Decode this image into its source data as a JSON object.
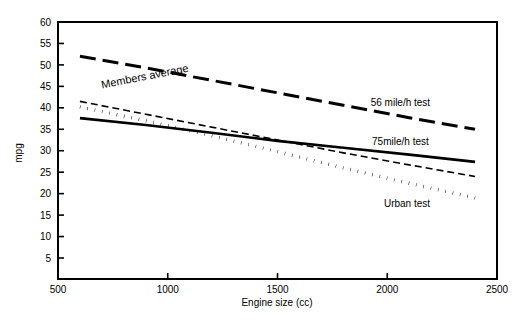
{
  "chart_data": {
    "type": "line",
    "title": "",
    "xlabel": "Engine size (cc)",
    "ylabel": "mpg",
    "xlim": [
      500,
      2500
    ],
    "ylim": [
      0,
      60
    ],
    "xticks": [
      500,
      1000,
      1500,
      2000,
      2500
    ],
    "xtick_labels": [
      "500",
      "1000",
      "1500",
      "2000",
      "2500"
    ],
    "yticks": [
      5,
      10,
      15,
      20,
      25,
      30,
      35,
      40,
      45,
      50,
      55,
      60
    ],
    "ytick_labels": [
      "5",
      "10",
      "15",
      "20",
      "25",
      "30",
      "35",
      "40",
      "45",
      "50",
      "55",
      "60"
    ],
    "grid": false,
    "legend_position": "inline-right",
    "series": [
      {
        "name": "56 mile/h test",
        "label": "56 mile/h test",
        "style": "long-dashed",
        "stroke_width": 3,
        "dasharray": "16 7",
        "label_x": 2060,
        "label_y": 40.5,
        "x": [
          600,
          900,
          1200,
          1500,
          1800,
          2100,
          2400
        ],
        "y": [
          52.0,
          49.3,
          46.4,
          43.5,
          40.6,
          37.7,
          35.0
        ]
      },
      {
        "name": "Members average",
        "label": "Members average",
        "style": "short-dashed",
        "stroke_width": 1.6,
        "dasharray": "7 4",
        "label_x": 700,
        "label_y": 44.5,
        "x": [
          600,
          900,
          1200,
          1500,
          1800,
          2100,
          2400
        ],
        "y": [
          41.5,
          38.5,
          35.5,
          32.5,
          29.5,
          26.7,
          24.0
        ]
      },
      {
        "name": "75mile/h test",
        "label": "75mile/h test",
        "style": "solid",
        "stroke_width": 2.6,
        "dasharray": "none",
        "label_x": 2060,
        "label_y": 31.3,
        "x": [
          600,
          900,
          1200,
          1500,
          1800,
          2100,
          2400
        ],
        "y": [
          37.6,
          36.0,
          34.2,
          32.3,
          30.7,
          29.1,
          27.4
        ]
      },
      {
        "name": "Urban test",
        "label": "Urban test",
        "style": "dotted",
        "stroke_width": 3.4,
        "dasharray": "0.5 7",
        "label_x": 2090,
        "label_y": 17.0,
        "x": [
          600,
          900,
          1200,
          1500,
          1800,
          2100,
          2400
        ],
        "y": [
          40.2,
          37.0,
          33.5,
          29.8,
          26.0,
          22.4,
          19.0
        ]
      }
    ]
  },
  "axes": {
    "x_axis_title": "Engine size (cc)",
    "y_axis_title": "mpg"
  }
}
